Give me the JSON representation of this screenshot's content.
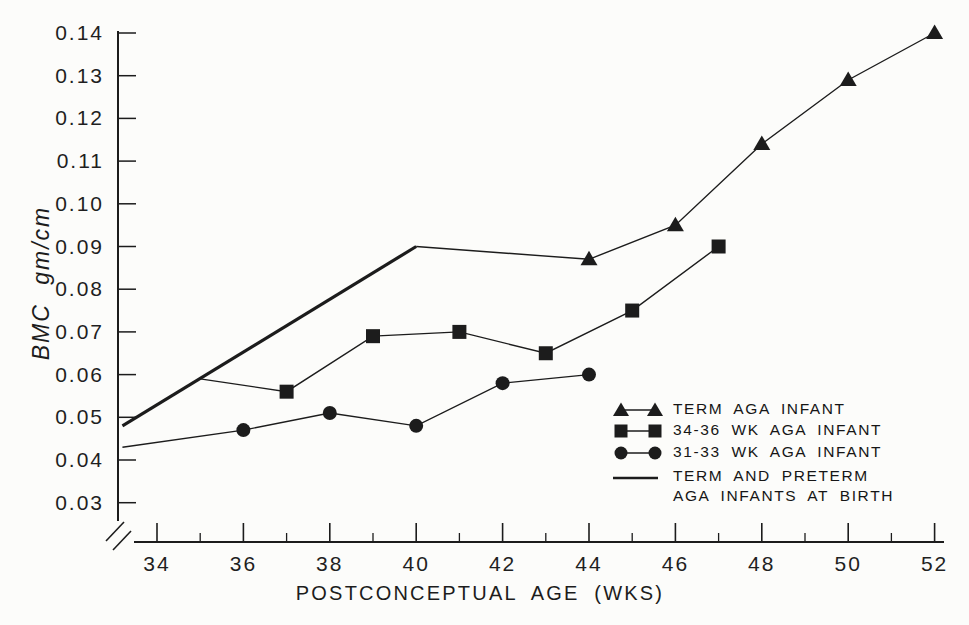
{
  "page": {
    "background": "#fcfcfa",
    "ink": "#1c1c1c"
  },
  "chart_data": {
    "type": "line",
    "title": "",
    "xlabel": "POSTCONCEPTUAL AGE (WKS)",
    "ylabel": "BMC gm/cm",
    "xlim": [
      33,
      53
    ],
    "ylim": [
      0.025,
      0.1455
    ],
    "x_axis": {
      "major_ticks": [
        34,
        36,
        38,
        40,
        42,
        44,
        46,
        48,
        50,
        52
      ],
      "minor_ticks": [
        35,
        37,
        39,
        41,
        43,
        45,
        47,
        49,
        51
      ],
      "axis_break_at_origin": true
    },
    "y_axis": {
      "tick_values": [
        0.03,
        0.04,
        0.05,
        0.06,
        0.07,
        0.08,
        0.09,
        0.1,
        0.11,
        0.12,
        0.13,
        0.14
      ],
      "tick_labels": [
        "0.03",
        "0.04",
        "0.05",
        "0.06",
        "0.07",
        "0.08",
        "0.09",
        "0.10",
        "0.11",
        "0.12",
        "0.13",
        "0.14"
      ]
    },
    "series": [
      {
        "name": "TERM AND PRETERM AGA INFANTS AT BIRTH",
        "marker": "none",
        "line_width": 3.2,
        "first_marker_index": 0,
        "points": [
          [
            33.2,
            0.048
          ],
          [
            40,
            0.09
          ]
        ]
      },
      {
        "name": "TERM AGA INFANT",
        "marker": "triangle",
        "line_width": 1.4,
        "first_marker_index": 1,
        "points": [
          [
            40,
            0.09
          ],
          [
            44,
            0.087
          ],
          [
            46,
            0.095
          ],
          [
            48,
            0.114
          ],
          [
            50,
            0.129
          ],
          [
            52,
            0.14
          ]
        ]
      },
      {
        "name": "34-36 WK AGA INFANT",
        "marker": "square",
        "line_width": 1.4,
        "first_marker_index": 1,
        "points": [
          [
            35,
            0.059
          ],
          [
            37,
            0.056
          ],
          [
            39,
            0.069
          ],
          [
            41,
            0.07
          ],
          [
            43,
            0.065
          ],
          [
            45,
            0.075
          ],
          [
            47,
            0.09
          ]
        ]
      },
      {
        "name": "31-33 WK AGA INFANT",
        "marker": "circle",
        "line_width": 1.4,
        "first_marker_index": 1,
        "points": [
          [
            33.2,
            0.043
          ],
          [
            36,
            0.047
          ],
          [
            38,
            0.051
          ],
          [
            40,
            0.048
          ],
          [
            42,
            0.058
          ],
          [
            44,
            0.06
          ]
        ]
      }
    ],
    "legend": {
      "position": "lower right",
      "items": [
        {
          "marker": "triangle",
          "label": "TERM AGA INFANT"
        },
        {
          "marker": "square",
          "label": "34-36 WK AGA INFANT"
        },
        {
          "marker": "circle",
          "label": "31-33 WK AGA INFANT"
        },
        {
          "marker": "line",
          "label_lines": [
            "TERM AND PRETERM",
            "AGA INFANTS AT BIRTH"
          ]
        }
      ]
    }
  }
}
